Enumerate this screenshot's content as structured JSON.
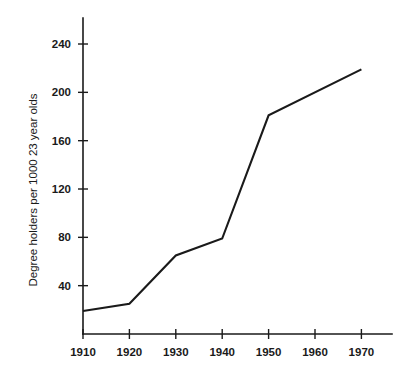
{
  "chart_data": {
    "type": "line",
    "title": "",
    "subtitle": "",
    "xlabel": "",
    "ylabel": "Degree holders per 1000 23 year olds",
    "x": [
      1910,
      1920,
      1930,
      1940,
      1950,
      1970
    ],
    "values": [
      19,
      25,
      65,
      79,
      181,
      219
    ],
    "series": [
      {
        "name": "Degree holders per 1000 23 year olds",
        "values": [
          19,
          25,
          65,
          79,
          181,
          219
        ]
      }
    ],
    "xtick_labels": [
      "1910",
      "1920",
      "1930",
      "1940",
      "1950",
      "1960",
      "1970"
    ],
    "xtick_values": [
      1910,
      1920,
      1930,
      1940,
      1950,
      1960,
      1970
    ],
    "ytick_labels": [
      "40",
      "80",
      "120",
      "160",
      "200",
      "240"
    ],
    "ytick_values": [
      40,
      80,
      120,
      160,
      200,
      240
    ],
    "xlim": [
      1910,
      1975
    ],
    "ylim": [
      0,
      255
    ],
    "grid": false,
    "legend": "none",
    "line_color": "#1a1a1a",
    "background_color": "#ffffff",
    "annotations": []
  },
  "geometry": {
    "plot_left": 83,
    "plot_right": 392,
    "baseline_y": 334,
    "axis_top_y": 18,
    "x_pixel_per_decade": 46.4,
    "y_pixel_per_unit": 1.2083,
    "y_zero_pixel": 334
  }
}
